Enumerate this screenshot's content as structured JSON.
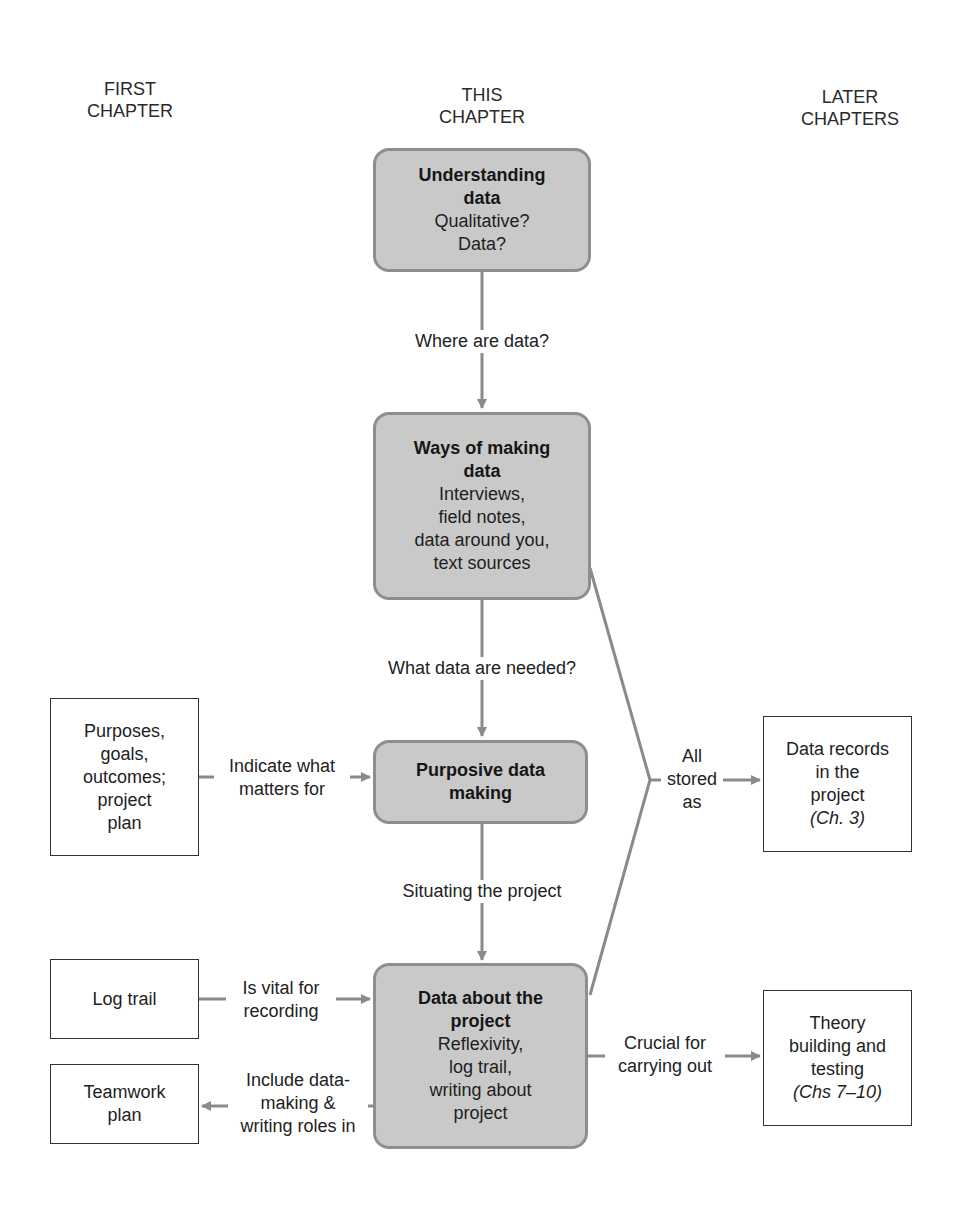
{
  "columns": {
    "first": [
      "FIRST",
      "CHAPTER"
    ],
    "this": [
      "THIS",
      "CHAPTER"
    ],
    "later": [
      "LATER",
      "CHAPTERS"
    ]
  },
  "center_nodes": [
    {
      "title": [
        "Understanding",
        "data"
      ],
      "body": [
        "Qualitative?",
        "Data?"
      ]
    },
    {
      "title": [
        "Ways of making",
        "data"
      ],
      "body": [
        "Interviews,",
        "field notes,",
        "data around you,",
        "text sources"
      ]
    },
    {
      "title": [
        "Purposive data",
        "making"
      ],
      "body": []
    },
    {
      "title": [
        "Data about the",
        "project"
      ],
      "body": [
        "Reflexivity,",
        "log trail,",
        "writing about",
        "project"
      ]
    }
  ],
  "left_nodes": [
    {
      "lines": [
        "Purposes,",
        "goals,",
        "outcomes;",
        "project",
        "plan"
      ]
    },
    {
      "lines": [
        "Log trail"
      ]
    },
    {
      "lines": [
        "Teamwork",
        "plan"
      ]
    }
  ],
  "right_nodes": [
    {
      "lines": [
        "Data records",
        "in the",
        "project"
      ],
      "ref": "(Ch. 3)"
    },
    {
      "lines": [
        "Theory",
        "building and",
        "testing"
      ],
      "ref": "(Chs 7–10)"
    }
  ],
  "edge_labels": {
    "where": [
      "Where are data?"
    ],
    "needed": [
      "What data are needed?"
    ],
    "indicate": [
      "Indicate what",
      "matters for"
    ],
    "situating": [
      "Situating the project"
    ],
    "vital": [
      "Is vital for",
      "recording"
    ],
    "include": [
      "Include data-",
      "making &",
      "writing roles in"
    ],
    "stored": [
      "All",
      "stored",
      "as"
    ],
    "crucial": [
      "Crucial for",
      "carrying out"
    ]
  },
  "colors": {
    "node_fill": "#c9c9c9",
    "node_border": "#8e8e8e",
    "arrow": "#8a8a8a"
  }
}
